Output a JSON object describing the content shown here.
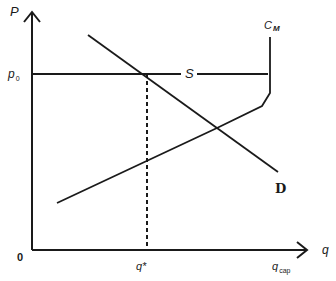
{
  "diagram": {
    "type": "economics-supply-demand-capacity",
    "axes": {
      "y_label": "P",
      "x_label": "q",
      "origin_label": "0"
    },
    "labels": {
      "price_level": "p",
      "price_level_sub": "0",
      "supply_curve": "S",
      "cost_curve": "C",
      "cost_curve_sub": "M",
      "demand_curve": "D",
      "equilibrium_quantity": "q*",
      "capacity_quantity": "q",
      "capacity_quantity_sub": "cap"
    },
    "colors": {
      "line": "#1a1a1a",
      "background": "#ffffff"
    },
    "geometry": {
      "origin": [
        32,
        250
      ],
      "y_axis_top": [
        32,
        12
      ],
      "x_axis_end": [
        306,
        250
      ],
      "price_line": {
        "y": 74,
        "x1": 32,
        "x2": 268
      },
      "demand": {
        "from": [
          88,
          35
        ],
        "to": [
          278,
          172
        ]
      },
      "marginal_cost": [
        [
          57,
          203
        ],
        [
          262,
          106
        ],
        [
          270,
          93
        ],
        [
          270,
          37
        ]
      ],
      "q_star_dashed": {
        "x": 147,
        "y1": 74,
        "y2": 250
      }
    }
  }
}
